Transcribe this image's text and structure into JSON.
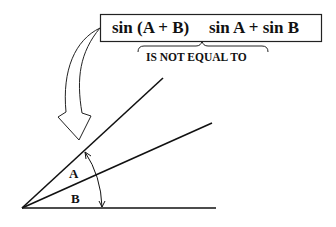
{
  "diagram": {
    "equation_box": {
      "left_expression": "sin (A + B)",
      "right_expression": "sin A + sin B"
    },
    "brace_note": "IS NOT EQUAL TO",
    "angles": [
      {
        "label": "A"
      },
      {
        "label": "B"
      }
    ],
    "colors": {
      "stroke": "#111111",
      "background": "#ffffff"
    }
  }
}
